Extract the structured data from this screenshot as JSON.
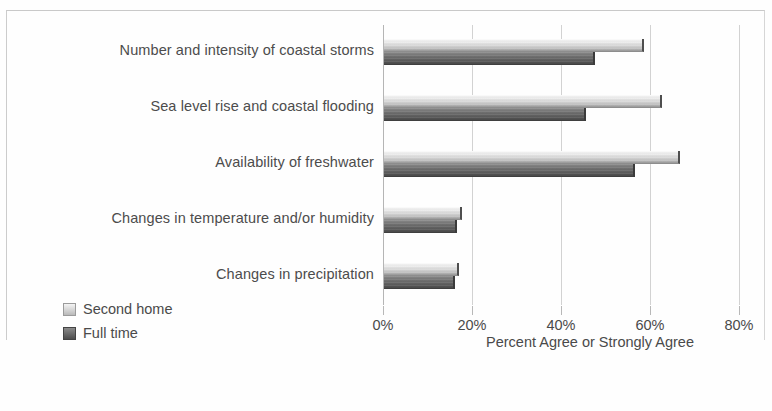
{
  "chart_data": {
    "type": "bar",
    "orientation": "horizontal",
    "title": "",
    "xlabel": "Percent Agree or Strongly Agree",
    "ylabel": "",
    "xlim": [
      0,
      80
    ],
    "grid": true,
    "legend_position": "bottom-left",
    "tick_labels": [
      "0%",
      "20%",
      "40%",
      "60%",
      "80%"
    ],
    "tick_values": [
      0,
      20,
      40,
      60,
      80
    ],
    "categories": [
      "Number and intensity of coastal storms",
      "Sea level rise and coastal flooding",
      "Availability of freshwater",
      "Changes in temperature and/or humidity",
      "Changes in precipitation"
    ],
    "series": [
      {
        "name": "Second home",
        "color": "#d2d2d2",
        "values": [
          58,
          62,
          66,
          17,
          16.5
        ]
      },
      {
        "name": "Full time",
        "color": "#5c5c5c",
        "values": [
          47,
          45,
          56,
          16,
          15.5
        ]
      }
    ]
  },
  "legend": {
    "items": [
      {
        "label": "Second home"
      },
      {
        "label": "Full time"
      }
    ]
  }
}
